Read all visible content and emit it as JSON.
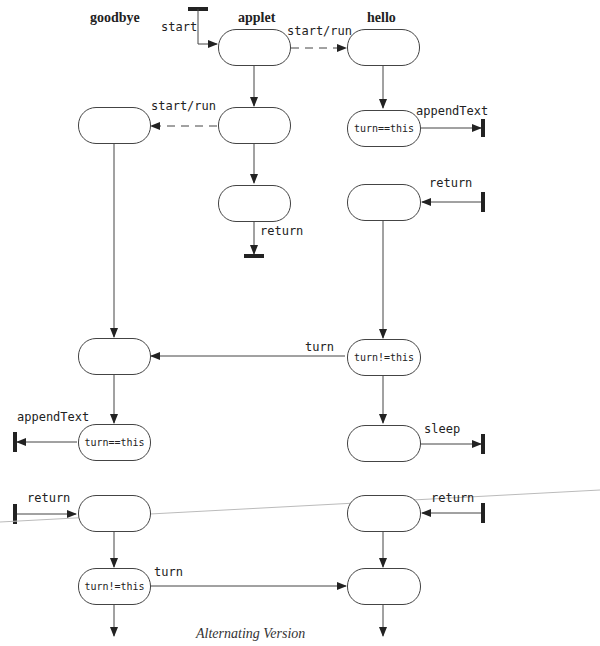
{
  "columns": {
    "goodbye": "goodbye",
    "applet": "applet",
    "hello": "hello"
  },
  "caption": "Alternating Version",
  "nodes": {
    "g1": "",
    "g2": "",
    "g3": "turn==this",
    "g4": "",
    "g5": "turn!=this",
    "a1": "",
    "a2": "",
    "a3": "",
    "h1": "",
    "h2": "turn==this",
    "h3": "",
    "h4": "turn!=this",
    "h5": "sleep_node",
    "h6": "",
    "h7": ""
  },
  "node_labels": {
    "g3": "turn==this",
    "g5": "turn!=this",
    "h2": "turn==this",
    "h4": "turn!=this"
  },
  "edges": {
    "start": "start",
    "start_run_1": "start/run",
    "start_run_2": "start/run",
    "appendText_hello": "appendText",
    "return_applet": "return",
    "return_hello_1": "return",
    "turn_1": "turn",
    "appendText_goodbye": "appendText",
    "sleep": "sleep",
    "return_goodbye": "return",
    "return_hello_2": "return",
    "turn_2": "turn"
  }
}
